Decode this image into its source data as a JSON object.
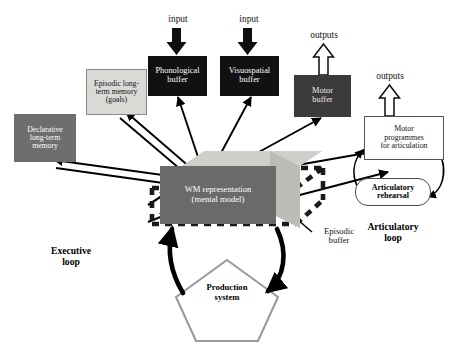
{
  "diagram": {
    "background_color": "#ffffff"
  },
  "boxes": {
    "phonological_buffer": {
      "label": "Phonological\nbuffer",
      "line1": "Phonological",
      "line2": "buffer",
      "fill": "#111111",
      "text_color": "#ffffff"
    },
    "visuospatial_buffer": {
      "label": "Visuospatial\nbuffer",
      "line1": "Visuospatial",
      "line2": "buffer",
      "fill": "#111111",
      "text_color": "#ffffff"
    },
    "motor_buffer": {
      "label": "Motor\nbuffer",
      "line1": "Motor",
      "line2": "buffer",
      "fill": "#3b3b3b",
      "text_color": "#e9e9e9"
    },
    "episodic_ltm": {
      "label": "Episodic long-term memory (goals)",
      "line1": "Episodic long-",
      "line2": "term memory",
      "line3": "(goals)",
      "fill": "#d9d9d6",
      "text_color": "#111111"
    },
    "declarative_ltm": {
      "label": "Declarative long-term memory",
      "line1": "Declarative",
      "line2": "long-term",
      "line3": "memory",
      "fill": "#6e6e6e",
      "text_color": "#ffffff"
    },
    "motor_programmes": {
      "label": "Motor programmes for articulation",
      "line1": "Motor",
      "line2": "programmes",
      "line3": "for articulation",
      "fill": "#ffffff",
      "text_color": "#111111"
    },
    "wm_representation": {
      "label": "WM representation (mental model)",
      "line1": "WM representation",
      "line2": "(mental model)",
      "fill": "#6a6a6a",
      "text_color": "#ffffff"
    },
    "articulatory_rehearsal": {
      "label": "Articulatory rehearsal",
      "line1": "Articulatory",
      "line2": "rehearsal",
      "fill": "#ffffff",
      "text_color": "#000000"
    },
    "production_system": {
      "label": "Production system",
      "line1": "Production",
      "line2": "system",
      "fill": "#ffffff",
      "outline": "#9a9a9a",
      "text_color": "#000000"
    }
  },
  "labels": {
    "input_left": "input",
    "input_right": "input",
    "outputs_motor_buffer": "outputs",
    "outputs_motor_programmes": "outputs",
    "episodic_buffer_line1": "Episodic",
    "episodic_buffer_line2": "buffer",
    "executive_loop_line1": "Executive",
    "executive_loop_line2": "loop",
    "articulatory_loop_line1": "Articulatory",
    "articulatory_loop_line2": "loop"
  },
  "colors": {
    "black_box": "#111111",
    "dark_gray_box": "#3b3b3b",
    "mid_gray_box": "#6e6e6e",
    "light_gray_box": "#d9d9d6",
    "wm_front": "#6a6a6a",
    "wm_top": "#cfcfcb",
    "wm_side": "#bcbcb8",
    "pentagon_outline": "#9a9a9a",
    "arrow": "#000000",
    "dashed_episodic": "#1a1a1a"
  }
}
